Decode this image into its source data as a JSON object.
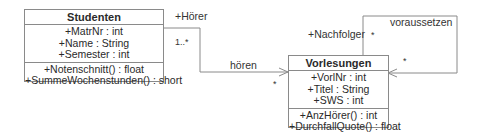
{
  "diagram_type": "UML class diagram",
  "classes": [
    {
      "id": "studenten",
      "name": "Studenten",
      "attributes": [
        {
          "text": "+MatrNr : int"
        },
        {
          "text": "+Name : String"
        },
        {
          "text": "+Semester : int"
        }
      ],
      "methods": [
        {
          "text": "+Notenschnitt() : float"
        },
        {
          "text": "+SummeWochenstunden() : short"
        }
      ]
    },
    {
      "id": "vorlesungen",
      "name": "Vorlesungen",
      "attributes": [
        {
          "text": "+VorlNr : int"
        },
        {
          "text": "+Titel : String"
        },
        {
          "text": "+SWS : int"
        }
      ],
      "methods": [
        {
          "text": "+AnzHörer() : int"
        },
        {
          "text": "+DurchfallQuote() : float"
        }
      ]
    }
  ],
  "associations": [
    {
      "name": "hören",
      "from": "Studenten",
      "to": "Vorlesungen",
      "source_role": "+Hörer",
      "source_multiplicity": "1..*",
      "target_multiplicity": "*",
      "navigable_to": "Vorlesungen"
    },
    {
      "name": "voraussetzen",
      "from": "Vorlesungen",
      "to": "Vorlesungen",
      "source_role": "+Nachfolger",
      "source_multiplicity": "*",
      "target_multiplicity": "*",
      "navigable_to": "Vorlesungen"
    }
  ],
  "colors": {
    "line": "#8a8a8a",
    "text": "#2a2a2a",
    "background": "#ffffff"
  }
}
